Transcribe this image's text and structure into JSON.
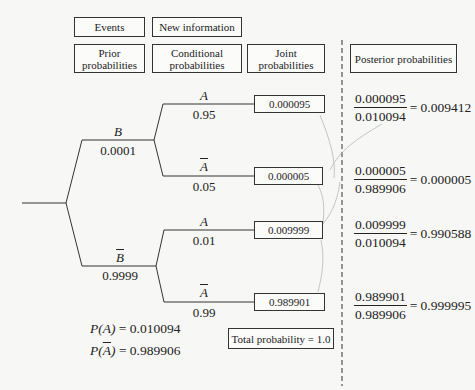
{
  "headers": {
    "events": "Events",
    "new_information": "New information",
    "prior": "Prior probabilities",
    "conditional": "Conditional probabilities",
    "joint": "Joint probabilities",
    "posterior": "Posterior probabilities"
  },
  "tree": {
    "branch_B": {
      "event": "B",
      "prob": "0.0001"
    },
    "branch_notB": {
      "event": "B",
      "prob": "0.9999"
    },
    "B_A": {
      "event": "A",
      "prob": "0.95"
    },
    "B_notA": {
      "event": "A",
      "prob": "0.05"
    },
    "notB_A": {
      "event": "A",
      "prob": "0.01"
    },
    "notB_notA": {
      "event": "A",
      "prob": "0.99"
    }
  },
  "joint": [
    "0.000095",
    "0.000005",
    "0.009999",
    "0.989901"
  ],
  "total_probability": "Total probability = 1.0",
  "marginals": {
    "pA_label": "P(A)",
    "pA_value": "= 0.010094",
    "pnotA_label_pre": "P(",
    "pnotA_label_event": "A",
    "pnotA_label_post": ")",
    "pnotA_value": "= 0.989906"
  },
  "posterior": [
    {
      "num": "0.000095",
      "den": "0.010094",
      "result": "= 0.009412"
    },
    {
      "num": "0.000005",
      "den": "0.989906",
      "result": "= 0.000005"
    },
    {
      "num": "0.009999",
      "den": "0.010094",
      "result": "= 0.990588"
    },
    {
      "num": "0.989901",
      "den": "0.989906",
      "result": "= 0.999995"
    }
  ]
}
